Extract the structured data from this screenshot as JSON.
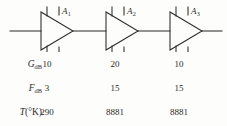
{
  "figure": {
    "type": "cascaded-amplifier-chain",
    "background_color": "#fdfdfb",
    "line_color": "#2b2b2b",
    "text_color": "#2b2b2b"
  },
  "circuit": {
    "stages": [
      {
        "id": "stage-1",
        "label_letter": "A",
        "label_sub": "1"
      },
      {
        "id": "stage-2",
        "label_letter": "A",
        "label_sub": "2"
      },
      {
        "id": "stage-3",
        "label_letter": "A",
        "label_sub": "3"
      }
    ]
  },
  "table": {
    "rows": [
      {
        "key": "gain",
        "label_letter": "G",
        "label_sub": "dB",
        "label_paren": "",
        "values": [
          "10",
          "20",
          "10"
        ]
      },
      {
        "key": "noise-figure",
        "label_letter": "F",
        "label_sub": "dB",
        "label_paren": "",
        "values": [
          "3",
          "15",
          "15"
        ]
      },
      {
        "key": "noise-temperature",
        "label_letter": "T",
        "label_sub": "",
        "label_paren": "(°K)",
        "values": [
          "290",
          "8881",
          "8881"
        ]
      }
    ]
  }
}
